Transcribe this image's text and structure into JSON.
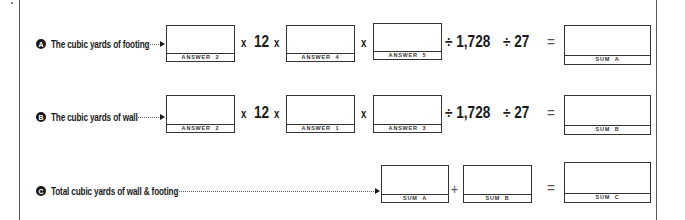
{
  "rows": {
    "a": {
      "badge": "A",
      "label": "The cubic yards of footing",
      "boxes": [
        "ANSWER  2",
        "ANSWER  4",
        "ANSWER  5"
      ],
      "multiplier": "12",
      "times": "x",
      "divide_by_1": "÷ 1,728",
      "divide_by_2": "÷ 27",
      "equals": "=",
      "result": "SUM  A"
    },
    "b": {
      "badge": "B",
      "label": "The cubic yards of wall",
      "boxes": [
        "ANSWER  2",
        "ANSWER  1",
        "ANSWER  3"
      ],
      "multiplier": "12",
      "times": "x",
      "divide_by_1": "÷ 1,728",
      "divide_by_2": "÷ 27",
      "equals": "=",
      "result": "SUM  B"
    },
    "c": {
      "badge": "C",
      "label": "Total cubic yards of wall & footing",
      "boxes": [
        "SUM  A",
        "SUM  B"
      ],
      "plus": "+",
      "equals": "=",
      "result": "SUM  C"
    }
  },
  "colors": {
    "ink": "#1a1a1a",
    "border": "#333333",
    "frame": "#555555"
  }
}
